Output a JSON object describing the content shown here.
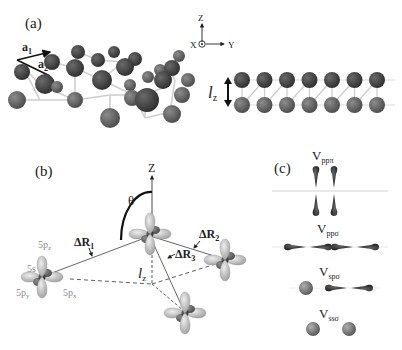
{
  "panels": {
    "a": {
      "label": "(a)",
      "lattice_vector_1": "a",
      "lattice_vector_1_sub": "1",
      "lattice_vector_2": "a",
      "lattice_vector_2_sub": "2",
      "axes": {
        "z": "Z",
        "x": "X",
        "y": "Y"
      },
      "side_view_spacing_label": "l",
      "side_view_spacing_sub": "z",
      "side_view_columns": 7
    },
    "b": {
      "label": "(b)",
      "z_axis": "Z",
      "angle": "θ",
      "bond_labels": [
        {
          "text": "ΔR",
          "sub": "1"
        },
        {
          "text": "ΔR",
          "sub": "2"
        },
        {
          "text": "ΔR",
          "sub": "3"
        }
      ],
      "height_label": "l",
      "height_sub": "z",
      "orbital_labels": [
        {
          "text": "5p",
          "sub": "z"
        },
        {
          "text": "5s",
          "sub": ""
        },
        {
          "text": "5p",
          "sub": "y"
        },
        {
          "text": "5p",
          "sub": "x"
        }
      ]
    },
    "c": {
      "label": "(c)",
      "bonds": [
        {
          "text": "V",
          "sub": "ppπ"
        },
        {
          "text": "V",
          "sub": "ppσ"
        },
        {
          "text": "V",
          "sub": "spσ"
        },
        {
          "text": "V",
          "sub": "ssσ"
        }
      ]
    }
  },
  "colors": {
    "atom_dark": "#3a3a3a",
    "atom_mid": "#5e5e5e",
    "atom_light": "#7a7a7a",
    "bond": "#c8c8c8",
    "orbital_light": "#c9c9c9",
    "orbital_dark": "#1e1e1e",
    "label_grey": "#8a8a8a"
  }
}
